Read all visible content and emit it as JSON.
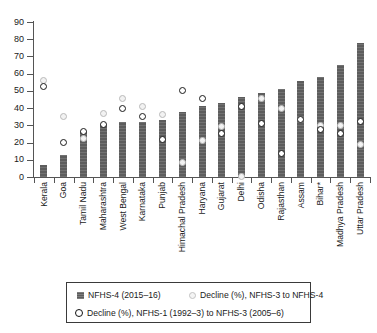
{
  "chart_data": {
    "type": "bar",
    "title": "",
    "subtitle": "",
    "xlabel": "",
    "ylabel": "",
    "ylim": [
      0,
      90
    ],
    "yticks": [
      0,
      10,
      20,
      30,
      40,
      50,
      60,
      70,
      80,
      90
    ],
    "grid": false,
    "legend_position": "bottom",
    "categories": [
      "Kerala",
      "Goa",
      "Tamil Nadu",
      "Maharashtra",
      "West Bengal",
      "Karnataka",
      "Punjab",
      "Himachal Pradesh",
      "Haryana",
      "Gujarat",
      "Delhi",
      "Odisha",
      "Rajasthan",
      "Assam",
      "Bihar*",
      "Madhya Pradesh",
      "Uttar Pradesh"
    ],
    "series": [
      {
        "name": "NFHS-4 (2015–16)",
        "type": "bar",
        "color": "#5d5d5d",
        "values": [
          7,
          13,
          26.5,
          30.5,
          32,
          32,
          33,
          38,
          41,
          43,
          46.5,
          48.5,
          51,
          56,
          58,
          65,
          78
        ]
      },
      {
        "name": "Decline (%), NFHS-3 to NFHS-4",
        "type": "scatter",
        "marker": "light-circle",
        "color": "#f2f2f2",
        "values": [
          56,
          35,
          22.5,
          37,
          45.5,
          41,
          36.5,
          8.5,
          21,
          29.5,
          0.5,
          45.5,
          39.5,
          33.5,
          30,
          30,
          19
        ]
      },
      {
        "name": "Decline (%), NFHS-1 (1992–3) to NFHS-3 (2005–6)",
        "type": "scatter",
        "marker": "open-circle",
        "color": "#111111",
        "values": [
          52.5,
          20,
          26.5,
          30.5,
          39.5,
          35,
          22,
          50.5,
          45.5,
          25.5,
          41,
          31,
          13.5,
          33.5,
          27.5,
          25,
          32
        ]
      }
    ]
  },
  "legend": {
    "items": [
      {
        "label": "NFHS-4 (2015–16)",
        "swatch": "filled-square-icon"
      },
      {
        "label": "Decline (%), NFHS-3 to NFHS-4",
        "swatch": "light-circle-icon"
      },
      {
        "label": "Decline (%), NFHS-1 (1992–3) to NFHS-3 (2005–6)",
        "swatch": "open-circle-icon"
      }
    ]
  },
  "axis": {
    "y_tick_labels": [
      "0",
      "10",
      "20",
      "30",
      "40",
      "50",
      "60",
      "70",
      "80",
      "90"
    ]
  }
}
